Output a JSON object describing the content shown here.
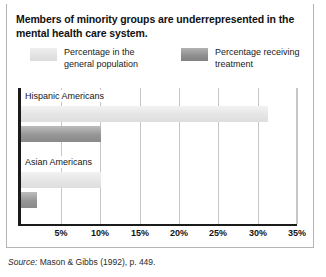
{
  "figure": {
    "title": "Members of minority groups are underrepresented in the mental health care system.",
    "source_prefix": "Source:",
    "source_text": "Mason & Gibbs (1992), p. 449."
  },
  "legend": {
    "items": [
      {
        "label": "Percentage in the general population",
        "swatch": "light-gray-gradient",
        "color": "#e2e2e2"
      },
      {
        "label": "Percentage receiving treatment",
        "swatch": "dark-gray-gradient",
        "color": "#969696"
      }
    ]
  },
  "chart_data": {
    "type": "bar",
    "orientation": "horizontal",
    "title": "Members of minority groups are underrepresented in the mental health care system.",
    "xlabel": "",
    "ylabel": "",
    "categories": [
      "Hispanic Americans",
      "Asian Americans"
    ],
    "series": [
      {
        "name": "Percentage in the general population",
        "values": [
          31,
          10
        ],
        "color": "#e2e2e2"
      },
      {
        "name": "Percentage receiving treatment",
        "values": [
          10,
          2
        ],
        "color": "#969696"
      }
    ],
    "xlim": [
      0,
      35
    ],
    "xticks": [
      0,
      5,
      10,
      15,
      20,
      25,
      30,
      35
    ],
    "xtick_labels": [
      "",
      "5%",
      "10%",
      "15%",
      "20%",
      "25%",
      "30%",
      "35%"
    ],
    "grid": true,
    "grid_axis": "x",
    "legend_position": "top",
    "source": "Source: Mason & Gibbs (1992), p. 449."
  }
}
